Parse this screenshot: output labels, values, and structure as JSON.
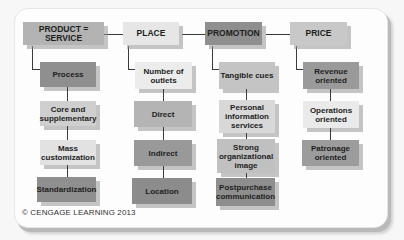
{
  "diagram": {
    "colors": {
      "light": "#e6e6e6",
      "lightmid": "#d2d2d2",
      "medium": "#b8b8b8",
      "dark": "#8e8e8e",
      "line": "#3a3a3a"
    },
    "columns": [
      {
        "header": "PRODUCT = SERVICE",
        "items": [
          "Process",
          "Core and supplementary",
          "Mass customization",
          "Standardization"
        ]
      },
      {
        "header": "PLACE",
        "items": [
          "Number of outlets",
          "Direct",
          "Indirect",
          "Location"
        ]
      },
      {
        "header": "PROMOTION",
        "items": [
          "Tangible cues",
          "Personal information services",
          "Strong organizational image",
          "Postpurchase communication"
        ]
      },
      {
        "header": "PRICE",
        "items": [
          "Revenue oriented",
          "Operations oriented",
          "Patronage oriented"
        ]
      }
    ],
    "copyright": "© CENGAGE LEARNING 2013"
  }
}
